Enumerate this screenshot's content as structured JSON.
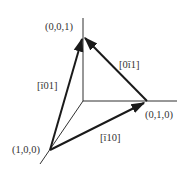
{
  "diagram": {
    "vertices": {
      "z": {
        "label": "(0,0,1)"
      },
      "y": {
        "label": "(0,1,0)"
      },
      "x": {
        "label": "(1,0,0)"
      }
    },
    "vectors": [
      {
        "label": "[Ā0 1]",
        "text": "[ī01]",
        "from": "(1,0,0)",
        "to": "(0,0,1)"
      },
      {
        "label": "[0ī1]",
        "from": "(0,1,0)",
        "to": "(0,0,1)"
      },
      {
        "label": "[ī10]",
        "from": "(1,0,0)",
        "to": "(0,1,0)"
      }
    ],
    "labels": {
      "v_z": "(0,0,1)",
      "v_y": "(0,1,0)",
      "v_x": "(1,0,0)",
      "d_101": "[ī01]",
      "d_011": "[0ī1]",
      "d_110": "[ī10]"
    },
    "colors": {
      "line": "#1a1a1a",
      "text": "#333333",
      "background": "#ffffff"
    }
  }
}
